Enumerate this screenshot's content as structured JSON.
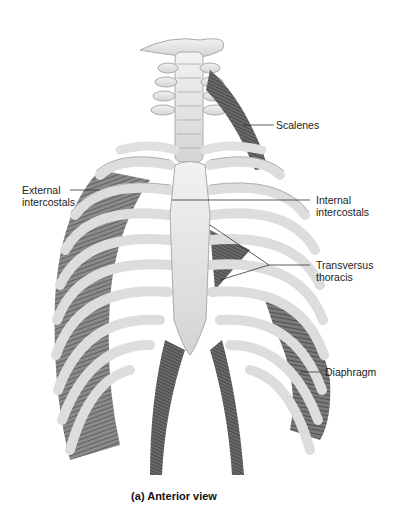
{
  "figure": {
    "caption": "(a) Anterior view",
    "labels": [
      {
        "id": "scalenes",
        "text": "Scalenes"
      },
      {
        "id": "external-intercostals",
        "text": "External\nintercostals",
        "line1": "External",
        "line2": "intercostals"
      },
      {
        "id": "internal-intercostals",
        "text": "Internal\nintercostals",
        "line1": "Internal",
        "line2": "intercostals"
      },
      {
        "id": "transversus-thoracis",
        "text": "Transversus\nthoracis",
        "line1": "Transversus",
        "line2": "thoracis"
      },
      {
        "id": "diaphragm",
        "text": "Diaphragm"
      }
    ],
    "colors": {
      "bone": "#e6e6e6",
      "bone_edge": "#a8a8a8",
      "muscle": "#6e6e6e",
      "muscle_dark": "#3a3a3a",
      "leader_line": "#333333",
      "background": "#ffffff"
    }
  }
}
